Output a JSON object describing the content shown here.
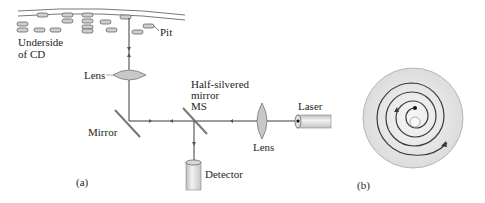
{
  "figure": {
    "panel_a": {
      "label": "(a)",
      "cd_label_line1": "Underside",
      "cd_label_line2": "of CD",
      "pit_label": "Pit",
      "lens_top_label": "Lens",
      "mirror_label": "Mirror",
      "half_mirror_line1": "Half-silvered",
      "half_mirror_line2": "mirror",
      "half_mirror_line3": "MS",
      "lens_right_label": "Lens",
      "laser_label": "Laser",
      "detector_label": "Detector"
    },
    "panel_b": {
      "label": "(b)"
    },
    "colors": {
      "line": "#3a3a3a",
      "lens_fill": "#c8c8c8",
      "disc_fill": "#e6e6e6",
      "pit_fill": "#cfcfcf"
    }
  }
}
